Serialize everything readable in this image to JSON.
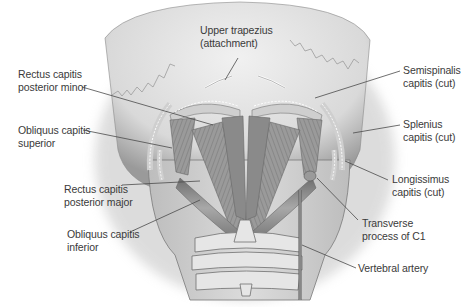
{
  "diagram": {
    "labels": [
      {
        "id": "upper-trapezius",
        "lines": [
          "Upper trapezius",
          "(attachment)"
        ],
        "x": 200,
        "y": 24
      },
      {
        "id": "rectus-capitis-posterior-minor",
        "lines": [
          "Rectus capitis",
          "posterior minor"
        ],
        "x": 18,
        "y": 68
      },
      {
        "id": "obliquus-capitis-superior",
        "lines": [
          "Obliquus capitis",
          "superior"
        ],
        "x": 18,
        "y": 127
      },
      {
        "id": "rectus-capitis-posterior-major",
        "lines": [
          "Rectus capitis",
          "posterior major"
        ],
        "x": 64,
        "y": 186
      },
      {
        "id": "obliquus-capitis-inferior",
        "lines": [
          "Obliquus capitis",
          "inferior"
        ],
        "x": 67,
        "y": 232
      },
      {
        "id": "semispinalis-capitis",
        "lines": [
          "Semispinalis",
          "capitis (cut)"
        ],
        "x": 403,
        "y": 67
      },
      {
        "id": "splenius-capitis",
        "lines": [
          "Splenius",
          "capitis (cut)"
        ],
        "x": 403,
        "y": 120
      },
      {
        "id": "longissimus-capitis",
        "lines": [
          "Longissimus",
          "capitis (cut)"
        ],
        "x": 392,
        "y": 175
      },
      {
        "id": "transverse-process-c1",
        "lines": [
          "Transverse",
          "process of C1"
        ],
        "x": 362,
        "y": 219
      },
      {
        "id": "vertebral-artery",
        "lines": [
          "Vertebral artery"
        ],
        "x": 358,
        "y": 263
      }
    ],
    "colors": {
      "skin": "#d7d7d7",
      "muscle": "#8e8e8e",
      "bone": "#e4e4e4",
      "text": "#3a3a3a",
      "leader": "#4a4a4a"
    }
  }
}
